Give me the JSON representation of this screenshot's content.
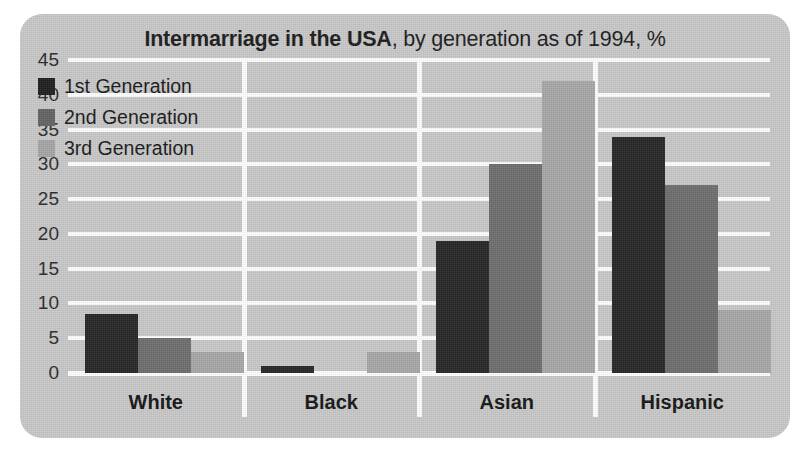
{
  "chart_data": {
    "type": "bar",
    "title": "Intermarriage in the USA, by generation as of 1994, %",
    "title_bold_part": "Intermarriage in the USA",
    "title_normal_part": ", by generation as of 1994, %",
    "xlabel": "",
    "ylabel": "",
    "ylim": [
      0,
      45
    ],
    "ytick_step": 5,
    "yticks": [
      45,
      40,
      35,
      30,
      25,
      20,
      15,
      10,
      5,
      0
    ],
    "grid": true,
    "legend_position": "inside-top-left",
    "categories": [
      "White",
      "Black",
      "Asian",
      "Hispanic"
    ],
    "series": [
      {
        "name": "1st Generation",
        "color": "#262626",
        "values": [
          8.5,
          1,
          19,
          34
        ]
      },
      {
        "name": "2nd Generation",
        "color": "#6e6e6e",
        "values": [
          5,
          0,
          30,
          27
        ]
      },
      {
        "name": "3rd Generation",
        "color": "#a8a8a8",
        "values": [
          3,
          3,
          42,
          9
        ]
      }
    ]
  },
  "figure": {
    "background_color": "#c9c9c9",
    "gridline_color": "#ffffff",
    "text_color": "#1b1b1b"
  }
}
